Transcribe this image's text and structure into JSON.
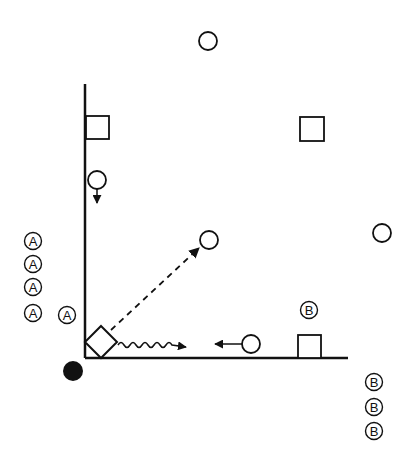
{
  "diagram": {
    "type": "play-diagram",
    "colors": {
      "ink": "#111111",
      "background": "#ffffff"
    },
    "lines": {
      "vertical_sideline": {
        "x1": 85,
        "y1": 84,
        "x2": 85,
        "y2": 358
      },
      "horizontal_baseline": {
        "x1": 85,
        "y1": 358,
        "x2": 348,
        "y2": 358
      }
    },
    "circles": [
      {
        "id": "circle-top",
        "cx": 208,
        "cy": 41,
        "r": 9
      },
      {
        "id": "circle-left-runner",
        "cx": 97,
        "cy": 180,
        "r": 9
      },
      {
        "id": "circle-center",
        "cx": 209,
        "cy": 240,
        "r": 9
      },
      {
        "id": "circle-right",
        "cx": 382,
        "cy": 233,
        "r": 9
      },
      {
        "id": "circle-bottom-runner",
        "cx": 251,
        "cy": 344,
        "r": 9
      }
    ],
    "squares": [
      {
        "id": "square-left",
        "x": 86,
        "y": 116,
        "size": 23
      },
      {
        "id": "square-upper-right",
        "x": 300,
        "y": 117,
        "size": 24
      },
      {
        "id": "square-bottom-right",
        "x": 298,
        "y": 335,
        "size": 23
      }
    ],
    "diamond": {
      "id": "diamond-corner",
      "cx": 101,
      "cy": 342,
      "half": 16
    },
    "black_dot": {
      "cx": 73,
      "cy": 371,
      "r": 10
    },
    "arrows": {
      "down_arrow": {
        "x1": 97,
        "y1": 189,
        "x2": 97,
        "y2": 203
      },
      "dashed_arrow": {
        "x1": 111,
        "y1": 330,
        "x2": 199,
        "y2": 248
      },
      "wavy_arrow": {
        "x1": 118,
        "y1": 345,
        "x2": 186,
        "y2": 347
      },
      "left_arrow": {
        "x1": 242,
        "y1": 344,
        "x2": 215,
        "y2": 344
      }
    },
    "labels": {
      "team_a": [
        {
          "text": "A",
          "cx": 33,
          "cy": 241
        },
        {
          "text": "A",
          "cx": 33,
          "cy": 264
        },
        {
          "text": "A",
          "cx": 33,
          "cy": 287
        },
        {
          "text": "A",
          "cx": 33,
          "cy": 313
        },
        {
          "text": "A",
          "cx": 67,
          "cy": 315
        }
      ],
      "team_b": [
        {
          "text": "B",
          "cx": 309,
          "cy": 310
        },
        {
          "text": "B",
          "cx": 374,
          "cy": 382
        },
        {
          "text": "B",
          "cx": 374,
          "cy": 407
        },
        {
          "text": "B",
          "cx": 374,
          "cy": 431
        }
      ]
    }
  }
}
